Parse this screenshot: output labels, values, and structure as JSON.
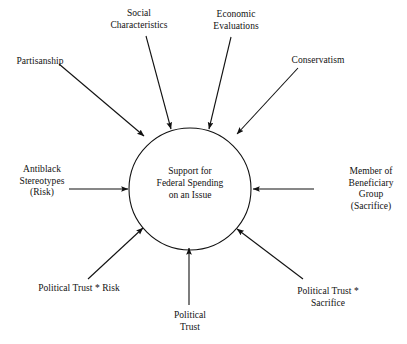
{
  "diagram": {
    "type": "conceptual-path-diagram",
    "center": {
      "id": "support-federal-spending",
      "label": "Support for\nFederal Spending\non an Issue",
      "shape": "circle",
      "cx": 190,
      "cy": 189,
      "r": 61
    },
    "style": {
      "stroke_color": "#111111",
      "background_color": "#ffffff",
      "text_color": "#111111",
      "stroke_width": 1.1
    },
    "nodes": [
      {
        "id": "partisanship",
        "label": "Partisanship",
        "x": 40,
        "y": 56,
        "align": "center",
        "arrow": {
          "x1": 59,
          "y1": 64,
          "x2": 144,
          "y2": 136
        }
      },
      {
        "id": "social-characteristics",
        "label": "Social\nCharacteristics",
        "x": 139,
        "y": 8,
        "align": "center",
        "arrow": {
          "x1": 146,
          "y1": 36,
          "x2": 171,
          "y2": 129
        }
      },
      {
        "id": "economic-evaluations",
        "label": "Economic\nEvaluations",
        "x": 236,
        "y": 9,
        "align": "center",
        "arrow": {
          "x1": 231,
          "y1": 37,
          "x2": 209,
          "y2": 129
        }
      },
      {
        "id": "conservatism",
        "label": "Conservatism",
        "x": 318,
        "y": 55,
        "align": "center",
        "arrow": {
          "x1": 298,
          "y1": 68,
          "x2": 237,
          "y2": 134
        }
      },
      {
        "id": "antiblack-stereotypes-risk",
        "label": "Antiblack\nStereotypes\n(Risk)",
        "x": 42,
        "y": 164,
        "align": "center",
        "arrow": {
          "x1": 69,
          "y1": 189,
          "x2": 128,
          "y2": 189
        }
      },
      {
        "id": "member-of-beneficiary-group-sacrifice",
        "label": "Member of\nBeneficiary Group\n(Sacrifice)",
        "x": 371,
        "y": 166,
        "align": "center",
        "arrow": {
          "x1": 314,
          "y1": 189,
          "x2": 253,
          "y2": 189
        }
      },
      {
        "id": "political-trust-risk",
        "label": "Political Trust * Risk",
        "x": 79,
        "y": 283,
        "align": "center",
        "arrow": {
          "x1": 88,
          "y1": 279,
          "x2": 143,
          "y2": 228
        }
      },
      {
        "id": "political-trust",
        "label": "Political\nTrust",
        "x": 190,
        "y": 310,
        "align": "center",
        "arrow": {
          "x1": 189,
          "y1": 305,
          "x2": 189,
          "y2": 248
        }
      },
      {
        "id": "political-trust-sacrifice",
        "label": "Political Trust * Sacrifice",
        "x": 328,
        "y": 286,
        "align": "center",
        "arrow": {
          "x1": 303,
          "y1": 279,
          "x2": 237,
          "y2": 229
        }
      }
    ]
  }
}
